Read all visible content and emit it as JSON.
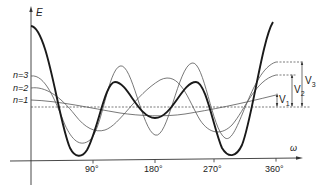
{
  "figure": {
    "y_axis_label": "E",
    "x_axis_label": "ω",
    "x_ticks": [
      "90°",
      "180°",
      "270°",
      "360°"
    ],
    "level_labels": [
      "n=3",
      "n=2",
      "n=1"
    ],
    "bracket_labels": {
      "v3": "V",
      "v3_sub": "3",
      "v2": "V",
      "v2_sub": "2",
      "v1": "V",
      "v1_sub": "1"
    },
    "colors": {
      "axis": "#333333",
      "thick_curve": "#1a1a1a",
      "thin_curve": "#555555",
      "dashed": "#444444"
    }
  }
}
